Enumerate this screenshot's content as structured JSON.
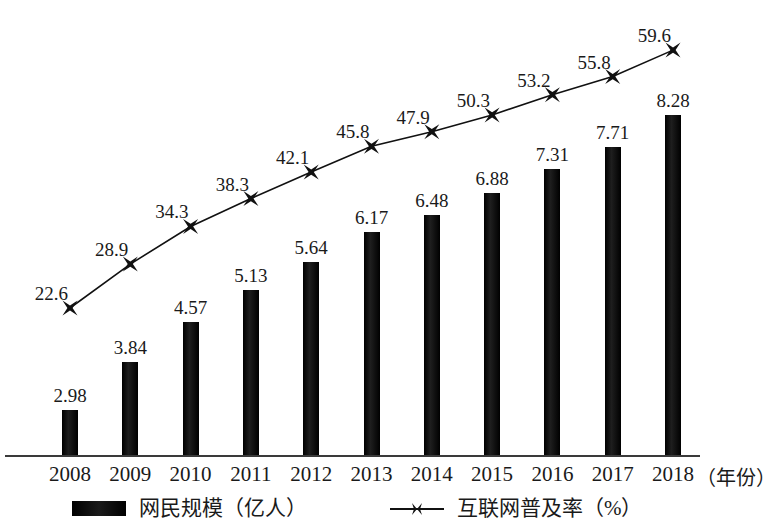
{
  "chart_data": {
    "type": "bar",
    "title": "",
    "subtitle": "",
    "xlabel": "（年份）",
    "ylabel": "",
    "grid": false,
    "legend_position": "bottom",
    "categories": [
      "2008",
      "2009",
      "2010",
      "2011",
      "2012",
      "2013",
      "2014",
      "2015",
      "2016",
      "2017",
      "2018"
    ],
    "series": [
      {
        "name": "网民规模（亿人）",
        "type": "bar",
        "unit": "亿人",
        "values": [
          2.98,
          3.84,
          4.57,
          5.13,
          5.64,
          6.17,
          6.48,
          6.88,
          7.31,
          7.71,
          8.28
        ],
        "labels": [
          "2.98",
          "3.84",
          "4.57",
          "5.13",
          "5.64",
          "6.17",
          "6.48",
          "6.88",
          "7.31",
          "7.71",
          "8.28"
        ],
        "color": "#111111"
      },
      {
        "name": "互联网普及率（%）",
        "type": "line",
        "unit": "%",
        "values": [
          22.6,
          28.9,
          34.3,
          38.3,
          42.1,
          45.8,
          47.9,
          50.3,
          53.2,
          55.8,
          59.6
        ],
        "labels": [
          "22.6",
          "28.9",
          "34.3",
          "38.3",
          "42.1",
          "45.8",
          "47.9",
          "50.3",
          "53.2",
          "55.8",
          "59.6"
        ],
        "color": "#111111",
        "marker": "x-bowtie"
      }
    ]
  },
  "legend": {
    "bar_label": "网民规模（亿人）",
    "line_label": "互联网普及率（%）"
  },
  "axis": {
    "x_unit_label": "（年份）"
  }
}
